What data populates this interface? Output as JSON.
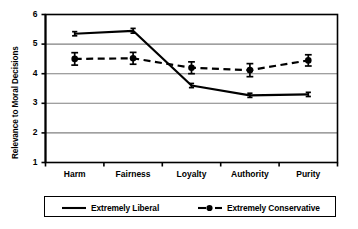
{
  "chart_data": {
    "type": "line",
    "title": "",
    "xlabel": "",
    "ylabel": "Relevance to Moral Decisions",
    "categories": [
      "Harm",
      "Fairness",
      "Loyalty",
      "Authority",
      "Purity"
    ],
    "ylim": [
      1,
      6
    ],
    "yticks": [
      1,
      2,
      3,
      4,
      5,
      6
    ],
    "ytick_labels": [
      "1",
      "2",
      "3",
      "4",
      "5",
      "6"
    ],
    "grid": true,
    "grid_axis": "y",
    "legend_position": "bottom",
    "series": [
      {
        "name": "Extremely Liberal",
        "values": [
          5.35,
          5.45,
          3.6,
          3.27,
          3.3
        ],
        "errors": [
          0.07,
          0.08,
          0.07,
          0.07,
          0.07
        ],
        "line_style": "solid",
        "marker": "none",
        "color": "#000000"
      },
      {
        "name": "Extremely Conservative",
        "values": [
          4.5,
          4.52,
          4.2,
          4.12,
          4.45
        ],
        "errors": [
          0.21,
          0.2,
          0.2,
          0.22,
          0.19
        ],
        "line_style": "dashed",
        "marker": "circle",
        "color": "#000000"
      }
    ]
  },
  "legend": {
    "items": [
      {
        "label": "Extremely Liberal",
        "style": "solid-line"
      },
      {
        "label": "Extremely Conservative",
        "style": "dashed-line-with-marker"
      }
    ]
  },
  "colors": {
    "axis": "#000000",
    "grid": "#808080",
    "series": "#000000",
    "background": "#ffffff"
  }
}
